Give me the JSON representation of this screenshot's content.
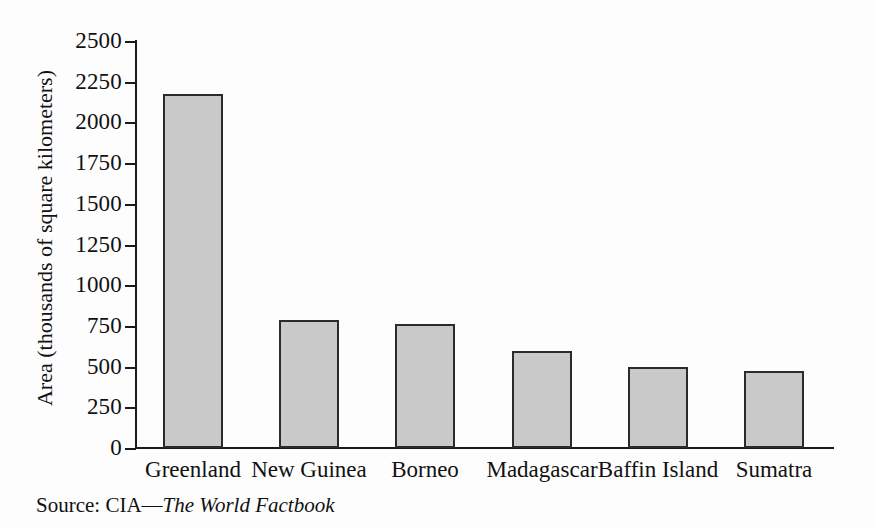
{
  "chart_data": {
    "type": "bar",
    "title": "",
    "subtitle": "",
    "xlabel": "",
    "ylabel": "Area (thousands of square kilometers)",
    "categories": [
      "Greenland",
      "New Guinea",
      "Borneo",
      "Madagascar",
      "Baffin Island",
      "Sumatra"
    ],
    "values": [
      2175,
      785,
      760,
      595,
      495,
      475
    ],
    "ylim": [
      0,
      2500
    ],
    "y_ticks": [
      0,
      250,
      500,
      750,
      1000,
      1250,
      1500,
      1750,
      2000,
      2250,
      2500
    ],
    "y_tick_labels": [
      "0",
      "250",
      "500",
      "750",
      "1000",
      "1250",
      "1500",
      "1750",
      "2000",
      "2250",
      "2500"
    ],
    "grid": false,
    "legend": false,
    "legend_position": "none",
    "bar_fill_color": "#c9c9c9",
    "bar_edge_color": "#2b2b2b",
    "axis_color": "#1a1a1a",
    "background_color": "#fdfdfd"
  },
  "source": {
    "prefix": "Source: CIA",
    "dash": "—",
    "work_title": "The World Factbook"
  }
}
